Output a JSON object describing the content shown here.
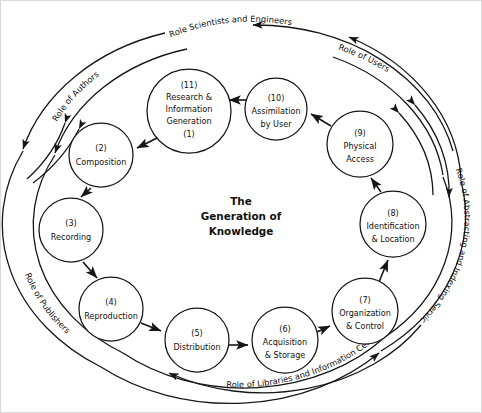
{
  "diagram": {
    "title_lines": [
      "The",
      "Generation of",
      "Knowledge"
    ],
    "center_title": "The Generation of Knowledge",
    "nodes": [
      {
        "id": "n1",
        "number_top": "(11)",
        "number_bottom": "(1)",
        "label_lines": [
          "Research &",
          "Information",
          "Generation"
        ],
        "name": "Research & Information Generation",
        "cx": 188,
        "cy": 110,
        "r": 42
      },
      {
        "id": "n2",
        "number_top": "(2)",
        "number_bottom": "",
        "label_lines": [
          "Composition"
        ],
        "name": "Composition",
        "cx": 100,
        "cy": 154,
        "r": 32
      },
      {
        "id": "n3",
        "number_top": "(3)",
        "number_bottom": "",
        "label_lines": [
          "Recording"
        ],
        "name": "Recording",
        "cx": 70,
        "cy": 229,
        "r": 32
      },
      {
        "id": "n4",
        "number_top": "(4)",
        "number_bottom": "",
        "label_lines": [
          "Reproduction"
        ],
        "name": "Reproduction",
        "cx": 110,
        "cy": 308,
        "r": 32
      },
      {
        "id": "n5",
        "number_top": "(5)",
        "number_bottom": "",
        "label_lines": [
          "Distribution"
        ],
        "name": "Distribution",
        "cx": 196,
        "cy": 339,
        "r": 32
      },
      {
        "id": "n6",
        "number_top": "(6)",
        "number_bottom": "",
        "label_lines": [
          "Acquisition",
          "& Storage"
        ],
        "name": "Acquisition & Storage",
        "cx": 284,
        "cy": 339,
        "r": 33
      },
      {
        "id": "n7",
        "number_top": "(7)",
        "number_bottom": "",
        "label_lines": [
          "Organization",
          "& Control"
        ],
        "name": "Organization & Control",
        "cx": 364,
        "cy": 310,
        "r": 33
      },
      {
        "id": "n8",
        "number_top": "(8)",
        "number_bottom": "",
        "label_lines": [
          "Identification",
          "& Location"
        ],
        "name": "Identification & Location",
        "cx": 392,
        "cy": 223,
        "r": 33
      },
      {
        "id": "n9",
        "number_top": "(9)",
        "number_bottom": "",
        "label_lines": [
          "Physical",
          "Access"
        ],
        "name": "Physical Access",
        "cx": 359,
        "cy": 143,
        "r": 33
      },
      {
        "id": "n10",
        "number_top": "(10)",
        "number_bottom": "",
        "label_lines": [
          "Assimilation",
          "by User"
        ],
        "name": "Assimilation by User",
        "cx": 275,
        "cy": 108,
        "r": 31
      }
    ],
    "ring_labels": [
      {
        "id": "role-authors",
        "text": "Role of Authors",
        "position": "upper-left"
      },
      {
        "id": "role-scientists-engineers",
        "text": "Role Scientists and Engineers",
        "position": "top"
      },
      {
        "id": "role-users",
        "text": "Role of Users",
        "position": "upper-right"
      },
      {
        "id": "role-abstracting-indexing",
        "text": "Role of Abstracting and Indexing Services",
        "position": "right"
      },
      {
        "id": "role-libraries",
        "text": "Role of Libraries and Information Centers",
        "position": "bottom"
      },
      {
        "id": "role-publishers",
        "text": "Role of Publishers",
        "position": "lower-left"
      }
    ],
    "flow_sequence": [
      "Research & Information Generation",
      "Composition",
      "Recording",
      "Reproduction",
      "Distribution",
      "Acquisition & Storage",
      "Organization & Control",
      "Identification & Location",
      "Physical Access",
      "Assimilation by User",
      "Research & Information Generation"
    ],
    "colors": {
      "stroke": "#161616",
      "background": "#ffffff",
      "text": "#111111"
    }
  }
}
